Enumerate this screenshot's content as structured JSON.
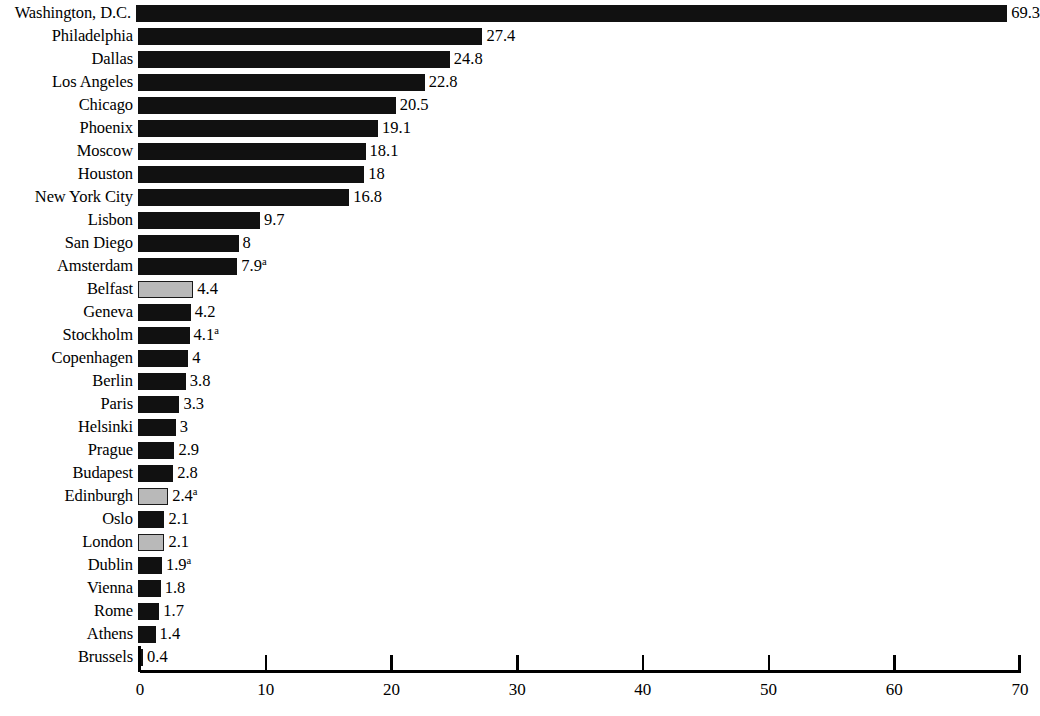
{
  "chart_data": {
    "type": "bar",
    "orientation": "horizontal",
    "title": "",
    "subtitle": "",
    "xlabel": "",
    "ylabel": "",
    "xlim": [
      0,
      70
    ],
    "xticks": [
      0,
      10,
      20,
      30,
      40,
      50,
      60,
      70
    ],
    "xtick_labels": [
      "0",
      "10",
      "20",
      "30",
      "40",
      "50",
      "60",
      "70"
    ],
    "grid": false,
    "legend": "none",
    "footnote_marker": "a",
    "categories": [
      "Washington, D.C.",
      "Philadelphia",
      "Dallas",
      "Los Angeles",
      "Chicago",
      "Phoenix",
      "Moscow",
      "Houston",
      "New York City",
      "Lisbon",
      "San Diego",
      "Amsterdam",
      "Belfast",
      "Geneva",
      "Stockholm",
      "Copenhagen",
      "Berlin",
      "Paris",
      "Helsinki",
      "Prague",
      "Budapest",
      "Edinburgh",
      "Oslo",
      "London",
      "Dublin",
      "Vienna",
      "Rome",
      "Athens",
      "Brussels"
    ],
    "values": [
      69.3,
      27.4,
      24.8,
      22.8,
      20.5,
      19.1,
      18.1,
      18,
      16.8,
      9.7,
      8,
      7.9,
      4.4,
      4.2,
      4.1,
      4,
      3.8,
      3.3,
      3,
      2.9,
      2.8,
      2.4,
      2.1,
      2.1,
      1.9,
      1.8,
      1.7,
      1.4,
      0.4
    ],
    "bars": [
      {
        "category": "Washington, D.C.",
        "value": 69.3,
        "label": "69.3",
        "footnote": "",
        "style": "dark"
      },
      {
        "category": "Philadelphia",
        "value": 27.4,
        "label": "27.4",
        "footnote": "",
        "style": "dark"
      },
      {
        "category": "Dallas",
        "value": 24.8,
        "label": "24.8",
        "footnote": "",
        "style": "dark"
      },
      {
        "category": "Los Angeles",
        "value": 22.8,
        "label": "22.8",
        "footnote": "",
        "style": "dark"
      },
      {
        "category": "Chicago",
        "value": 20.5,
        "label": "20.5",
        "footnote": "",
        "style": "dark"
      },
      {
        "category": "Phoenix",
        "value": 19.1,
        "label": "19.1",
        "footnote": "",
        "style": "dark"
      },
      {
        "category": "Moscow",
        "value": 18.1,
        "label": "18.1",
        "footnote": "",
        "style": "dark"
      },
      {
        "category": "Houston",
        "value": 18,
        "label": "18",
        "footnote": "",
        "style": "dark"
      },
      {
        "category": "New York City",
        "value": 16.8,
        "label": "16.8",
        "footnote": "",
        "style": "dark"
      },
      {
        "category": "Lisbon",
        "value": 9.7,
        "label": "9.7",
        "footnote": "",
        "style": "dark"
      },
      {
        "category": "San Diego",
        "value": 8,
        "label": "8",
        "footnote": "",
        "style": "dark"
      },
      {
        "category": "Amsterdam",
        "value": 7.9,
        "label": "7.9",
        "footnote": "a",
        "style": "dark"
      },
      {
        "category": "Belfast",
        "value": 4.4,
        "label": "4.4",
        "footnote": "",
        "style": "light"
      },
      {
        "category": "Geneva",
        "value": 4.2,
        "label": "4.2",
        "footnote": "",
        "style": "dark"
      },
      {
        "category": "Stockholm",
        "value": 4.1,
        "label": "4.1",
        "footnote": "a",
        "style": "dark"
      },
      {
        "category": "Copenhagen",
        "value": 4,
        "label": "4",
        "footnote": "",
        "style": "dark"
      },
      {
        "category": "Berlin",
        "value": 3.8,
        "label": "3.8",
        "footnote": "",
        "style": "dark"
      },
      {
        "category": "Paris",
        "value": 3.3,
        "label": "3.3",
        "footnote": "",
        "style": "dark"
      },
      {
        "category": "Helsinki",
        "value": 3,
        "label": "3",
        "footnote": "",
        "style": "dark"
      },
      {
        "category": "Prague",
        "value": 2.9,
        "label": "2.9",
        "footnote": "",
        "style": "dark"
      },
      {
        "category": "Budapest",
        "value": 2.8,
        "label": "2.8",
        "footnote": "",
        "style": "dark"
      },
      {
        "category": "Edinburgh",
        "value": 2.4,
        "label": "2.4",
        "footnote": "a",
        "style": "light"
      },
      {
        "category": "Oslo",
        "value": 2.1,
        "label": "2.1",
        "footnote": "",
        "style": "dark"
      },
      {
        "category": "London",
        "value": 2.1,
        "label": "2.1",
        "footnote": "",
        "style": "light"
      },
      {
        "category": "Dublin",
        "value": 1.9,
        "label": "1.9",
        "footnote": "a",
        "style": "dark"
      },
      {
        "category": "Vienna",
        "value": 1.8,
        "label": "1.8",
        "footnote": "",
        "style": "dark"
      },
      {
        "category": "Rome",
        "value": 1.7,
        "label": "1.7",
        "footnote": "",
        "style": "dark"
      },
      {
        "category": "Athens",
        "value": 1.4,
        "label": "1.4",
        "footnote": "",
        "style": "dark"
      },
      {
        "category": "Brussels",
        "value": 0.4,
        "label": "0.4",
        "footnote": "",
        "style": "dark"
      }
    ],
    "colors": {
      "bar_dark": "#111111",
      "bar_light": "#b9b9b9",
      "bar_light_border": "#1a1a1a",
      "axis": "#000000",
      "background": "#ffffff",
      "text": "#000000"
    }
  }
}
